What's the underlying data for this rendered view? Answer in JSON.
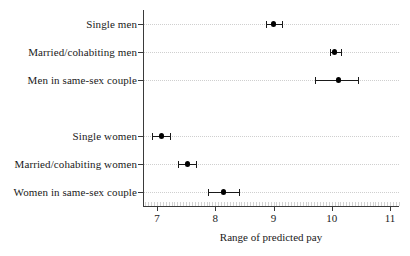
{
  "chart_data": {
    "type": "scatter",
    "title": "",
    "subtitle": "",
    "xlabel": "Range of predicted pay",
    "ylabel": "",
    "xlim": [
      6.6,
      11.25
    ],
    "xticks": [
      7,
      8,
      9,
      10,
      11
    ],
    "xticklabels": [
      "7",
      "8",
      "9",
      "10",
      "11"
    ],
    "grid": "horizontal-dotted",
    "legend": "none",
    "orientation": "horizontal",
    "marker": "filled-circle-with-error-bars",
    "categories": [
      "Single men",
      "Married/cohabiting men",
      "Men in same-sex couple",
      "",
      "Single women",
      "Married/cohabiting women",
      "Women in same-sex couple"
    ],
    "points": [
      {
        "category": "Single men",
        "value": 9.0,
        "ci_low": 8.87,
        "ci_high": 9.14,
        "row": 0
      },
      {
        "category": "Married/cohabiting men",
        "value": 10.05,
        "ci_low": 9.97,
        "ci_high": 10.16,
        "row": 1
      },
      {
        "category": "Men in same-sex couple",
        "value": 10.12,
        "ci_low": 9.72,
        "ci_high": 10.45,
        "row": 2
      },
      {
        "category": "Single women",
        "value": 7.08,
        "ci_low": 6.91,
        "ci_high": 7.22,
        "row": 4
      },
      {
        "category": "Married/cohabiting women",
        "value": 7.52,
        "ci_low": 7.36,
        "ci_high": 7.67,
        "row": 5
      },
      {
        "category": "Women in same-sex couple",
        "value": 8.14,
        "ci_low": 7.88,
        "ci_high": 8.41,
        "row": 6
      }
    ]
  },
  "axis": {
    "x_title": "Range of predicted pay"
  }
}
